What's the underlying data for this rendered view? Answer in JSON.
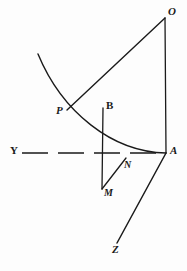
{
  "figure": {
    "name": "geometric-construction-diagram",
    "background_color": "#fdfdfd",
    "ink_color": "#1a1a1a",
    "stroke_width": 1.3,
    "width": 187,
    "height": 271,
    "labels": [
      {
        "id": "O",
        "text": "O",
        "x": 168,
        "y": 6,
        "style": "italic"
      },
      {
        "id": "P",
        "text": "P",
        "x": 56,
        "y": 105,
        "style": "italic"
      },
      {
        "id": "B",
        "text": "B",
        "x": 106,
        "y": 100,
        "style": "upright"
      },
      {
        "id": "A",
        "text": "A",
        "x": 170,
        "y": 145,
        "style": "italic"
      },
      {
        "id": "N",
        "text": "N",
        "x": 124,
        "y": 160,
        "style": "italic"
      },
      {
        "id": "M",
        "text": "M",
        "x": 104,
        "y": 188,
        "style": "italic"
      },
      {
        "id": "Y",
        "text": "Y",
        "x": 10,
        "y": 145,
        "style": "upright"
      },
      {
        "id": "Z",
        "text": "Z",
        "x": 112,
        "y": 244,
        "style": "italic"
      }
    ],
    "points": {
      "O": {
        "x": 165,
        "y": 18
      },
      "P": {
        "x": 67,
        "y": 110
      },
      "B": {
        "x": 103,
        "y": 108
      },
      "A": {
        "x": 166,
        "y": 153
      },
      "N": {
        "x": 125,
        "y": 159
      },
      "M": {
        "x": 102,
        "y": 188
      },
      "Z": {
        "x": 117,
        "y": 242
      },
      "curve_start": {
        "x": 38,
        "y": 54
      }
    },
    "strokes": [
      {
        "id": "curve-PA",
        "kind": "curve",
        "from": "curve_start",
        "to": "A",
        "control1": {
          "x": 62,
          "y": 112
        },
        "control2": {
          "x": 112,
          "y": 152
        }
      },
      {
        "id": "chord-PO",
        "kind": "line",
        "from": "P",
        "to": "O"
      },
      {
        "id": "vertical-OA",
        "kind": "line",
        "from": "O",
        "to": "A"
      },
      {
        "id": "vertical-BM",
        "kind": "line",
        "from": "B",
        "to": "M"
      },
      {
        "id": "segment-MN",
        "kind": "line",
        "from": "M",
        "to": "N"
      },
      {
        "id": "line-AZ",
        "kind": "line",
        "from": "A",
        "to": "Z"
      },
      {
        "id": "axis-YA",
        "kind": "dashed-line",
        "from": {
          "x": 22,
          "y": 153
        },
        "to": "A",
        "dash_pattern": "26 10"
      }
    ]
  }
}
